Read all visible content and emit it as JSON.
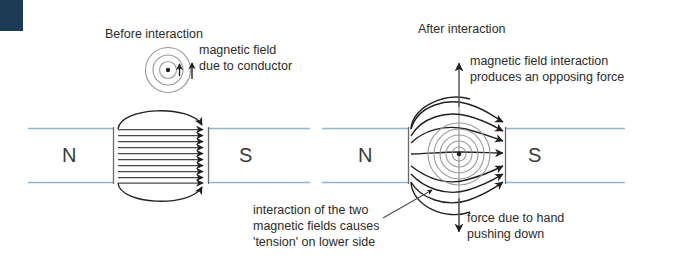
{
  "figure": {
    "domain": "physics-diagram",
    "kind": "magnetic field interaction / motor effect diagram",
    "background": "#ffffff",
    "corner_block_color": "#1d3b54",
    "ink_color": "#231f20",
    "pole_bar_color": "#8fb4cc",
    "conductor_circle_color": "#9a9a9a"
  },
  "panels": {
    "before": {
      "title": "Before interaction",
      "conductor_caption_line1": "magnetic field",
      "conductor_caption_line2": "due to conductor",
      "north_pole_label": "N",
      "south_pole_label": "S",
      "field_line_count": 10,
      "conductor_circle_count": 3,
      "current_direction": "out of page",
      "field_direction": "left to right (N to S)"
    },
    "after": {
      "title": "After interaction",
      "top_caption_line1": "magnetic field interaction",
      "top_caption_line2": "produces an opposing force",
      "bottom_left_caption_line1": "interaction of the two",
      "bottom_left_caption_line2": "magnetic fields causes",
      "bottom_left_caption_line3": "'tension' on lower side",
      "bottom_right_caption_line1": "force due to hand",
      "bottom_right_caption_line2": "pushing down",
      "north_pole_label": "N",
      "south_pole_label": "S",
      "field_line_count": 7,
      "conductor_circle_count": 5,
      "up_arrow_meaning": "opposing force (upward)",
      "down_arrow_meaning": "force due to hand pushing down"
    }
  }
}
